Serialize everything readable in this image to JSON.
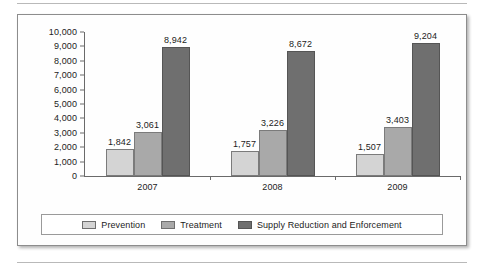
{
  "chart_data": {
    "type": "bar",
    "title": "",
    "subtitle": "",
    "xlabel": "",
    "ylabel": "",
    "categories": [
      "2007",
      "2008",
      "2009"
    ],
    "series": [
      {
        "name": "Prevention",
        "color": "#d4d4d4",
        "values": [
          1842,
          1757,
          1507
        ],
        "labels": [
          "1,842",
          "1,757",
          "1,507"
        ]
      },
      {
        "name": "Treatment",
        "color": "#a9a9a9",
        "values": [
          3061,
          3226,
          3403
        ],
        "labels": [
          "3,061",
          "3,226",
          "3,403"
        ]
      },
      {
        "name": "Supply Reduction and Enforcement",
        "color": "#6f6f6f",
        "values": [
          8942,
          8672,
          9204
        ],
        "labels": [
          "8,942",
          "8,672",
          "9,204"
        ]
      }
    ],
    "ylim": [
      0,
      10000
    ],
    "y_tick_step": 1000,
    "y_tick_labels": [
      "10,000",
      "9,000",
      "8,000",
      "7,000",
      "6,000",
      "5,000",
      "4,000",
      "3,000",
      "2,000",
      "1,000",
      "0"
    ],
    "y_tick_values": [
      10000,
      9000,
      8000,
      7000,
      6000,
      5000,
      4000,
      3000,
      2000,
      1000,
      0
    ],
    "grid": false,
    "legend_position": "bottom",
    "data_labels_shown": true
  },
  "legend": {
    "items": [
      {
        "label": "Prevention",
        "swatch": "prevention"
      },
      {
        "label": "Treatment",
        "swatch": "treatment"
      },
      {
        "label": "Supply Reduction and Enforcement",
        "swatch": "supply"
      }
    ]
  }
}
